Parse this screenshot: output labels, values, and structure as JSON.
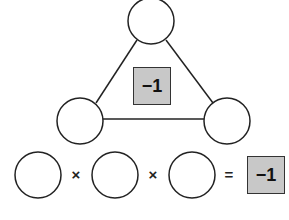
{
  "triangle": {
    "center_value": "−1",
    "nodes": [
      {
        "id": "top",
        "value": ""
      },
      {
        "id": "bottom-left",
        "value": ""
      },
      {
        "id": "bottom-right",
        "value": ""
      }
    ]
  },
  "equation": {
    "operands": [
      "",
      "",
      ""
    ],
    "operators": [
      "×",
      "×"
    ],
    "equals": "=",
    "result": "−1"
  },
  "colors": {
    "box_fill": "#c8c8c8",
    "stroke": "#222222"
  }
}
